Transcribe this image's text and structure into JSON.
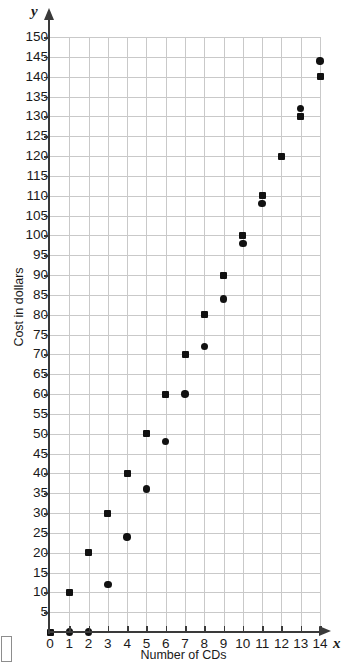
{
  "chart_data": {
    "type": "scatter",
    "title": "",
    "xlabel": "Number of CDs",
    "ylabel": "Cost in dollars",
    "x_axis_variable": "x",
    "y_axis_variable": "y",
    "xlim": [
      0,
      14
    ],
    "ylim": [
      0,
      150
    ],
    "grid": true,
    "legend_position": "none",
    "x_ticks": [
      0,
      1,
      2,
      3,
      4,
      5,
      6,
      7,
      8,
      9,
      10,
      11,
      12,
      13,
      14
    ],
    "y_ticks": [
      0,
      5,
      10,
      15,
      20,
      25,
      30,
      35,
      40,
      45,
      50,
      55,
      60,
      65,
      70,
      75,
      80,
      85,
      90,
      95,
      100,
      105,
      110,
      115,
      120,
      125,
      130,
      135,
      140,
      145,
      150
    ],
    "x_tick_labels": [
      "0",
      "1",
      "2",
      "3",
      "4",
      "5",
      "6",
      "7",
      "8",
      "9",
      "10",
      "11",
      "12",
      "13",
      "14"
    ],
    "y_tick_labels": [
      "5",
      "10",
      "15",
      "20",
      "25",
      "30",
      "35",
      "40",
      "45",
      "50",
      "55",
      "60",
      "65",
      "70",
      "75",
      "80",
      "85",
      "90",
      "95",
      "100",
      "105",
      "110",
      "115",
      "120",
      "125",
      "130",
      "135",
      "140",
      "145",
      "150"
    ],
    "y_gridline_step": 5,
    "x_gridline_step": 1,
    "series": [
      {
        "name": "Series A",
        "marker": "square",
        "color": "#111111",
        "points": [
          {
            "x": 0,
            "y": 0
          },
          {
            "x": 1,
            "y": 10
          },
          {
            "x": 2,
            "y": 20
          },
          {
            "x": 3,
            "y": 30
          },
          {
            "x": 4,
            "y": 40
          },
          {
            "x": 5,
            "y": 50
          },
          {
            "x": 6,
            "y": 60
          },
          {
            "x": 7,
            "y": 70
          },
          {
            "x": 8,
            "y": 80
          },
          {
            "x": 9,
            "y": 90
          },
          {
            "x": 10,
            "y": 100
          },
          {
            "x": 11,
            "y": 110
          },
          {
            "x": 12,
            "y": 120
          },
          {
            "x": 13,
            "y": 130
          },
          {
            "x": 14,
            "y": 140
          }
        ]
      },
      {
        "name": "Series B",
        "marker": "circle",
        "color": "#111111",
        "points": [
          {
            "x": 1,
            "y": 0
          },
          {
            "x": 2,
            "y": 0
          },
          {
            "x": 3,
            "y": 12
          },
          {
            "x": 4,
            "y": 24
          },
          {
            "x": 5,
            "y": 36
          },
          {
            "x": 6,
            "y": 48
          },
          {
            "x": 7,
            "y": 60
          },
          {
            "x": 8,
            "y": 72
          },
          {
            "x": 9,
            "y": 84
          },
          {
            "x": 10,
            "y": 98
          },
          {
            "x": 11,
            "y": 108
          },
          {
            "x": 13,
            "y": 132
          },
          {
            "x": 14,
            "y": 144
          }
        ]
      }
    ]
  },
  "colors": {
    "marker": "#111111",
    "grid": "#c9c9c9",
    "axis": "#3a3a3a",
    "text": "#1a1a1a",
    "background": "#ffffff"
  }
}
